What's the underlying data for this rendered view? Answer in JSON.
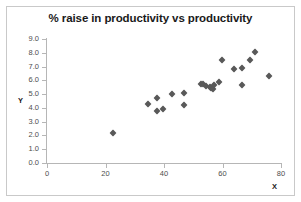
{
  "chart_data": {
    "type": "scatter",
    "title": "% raise in productivity vs productivity",
    "xlabel": "X",
    "ylabel": "Y",
    "xlim": [
      0,
      80
    ],
    "ylim": [
      0.0,
      9.0
    ],
    "xticks": [
      "0",
      "20",
      "40",
      "60",
      "80"
    ],
    "xtick_values": [
      0,
      20,
      40,
      60,
      80
    ],
    "yticks": [
      "0.0",
      "1.0",
      "2.0",
      "3.0",
      "4.0",
      "5.0",
      "6.0",
      "7.0",
      "8.0",
      "9.0"
    ],
    "ytick_values": [
      0.0,
      1.0,
      2.0,
      3.0,
      4.0,
      5.0,
      6.0,
      7.0,
      8.0,
      9.0
    ],
    "grid": false,
    "legend": false,
    "marker_color": "#595959",
    "marker_shape": "diamond",
    "points": [
      {
        "x": 22.6,
        "y": 2.2
      },
      {
        "x": 34.7,
        "y": 4.3
      },
      {
        "x": 37.7,
        "y": 4.7
      },
      {
        "x": 37.5,
        "y": 3.8
      },
      {
        "x": 39.8,
        "y": 3.95
      },
      {
        "x": 42.9,
        "y": 5.0
      },
      {
        "x": 46.9,
        "y": 5.1
      },
      {
        "x": 46.9,
        "y": 4.2
      },
      {
        "x": 52.5,
        "y": 5.7
      },
      {
        "x": 53.4,
        "y": 5.75
      },
      {
        "x": 54.5,
        "y": 5.6
      },
      {
        "x": 55.6,
        "y": 5.55
      },
      {
        "x": 56.2,
        "y": 5.45
      },
      {
        "x": 56.6,
        "y": 5.4
      },
      {
        "x": 57.2,
        "y": 5.65
      },
      {
        "x": 58.8,
        "y": 5.9
      },
      {
        "x": 59.9,
        "y": 7.5
      },
      {
        "x": 63.9,
        "y": 6.8
      },
      {
        "x": 66.6,
        "y": 6.9
      },
      {
        "x": 66.8,
        "y": 5.65
      },
      {
        "x": 69.4,
        "y": 7.5
      },
      {
        "x": 71.0,
        "y": 8.05
      },
      {
        "x": 76.0,
        "y": 6.3
      }
    ]
  }
}
